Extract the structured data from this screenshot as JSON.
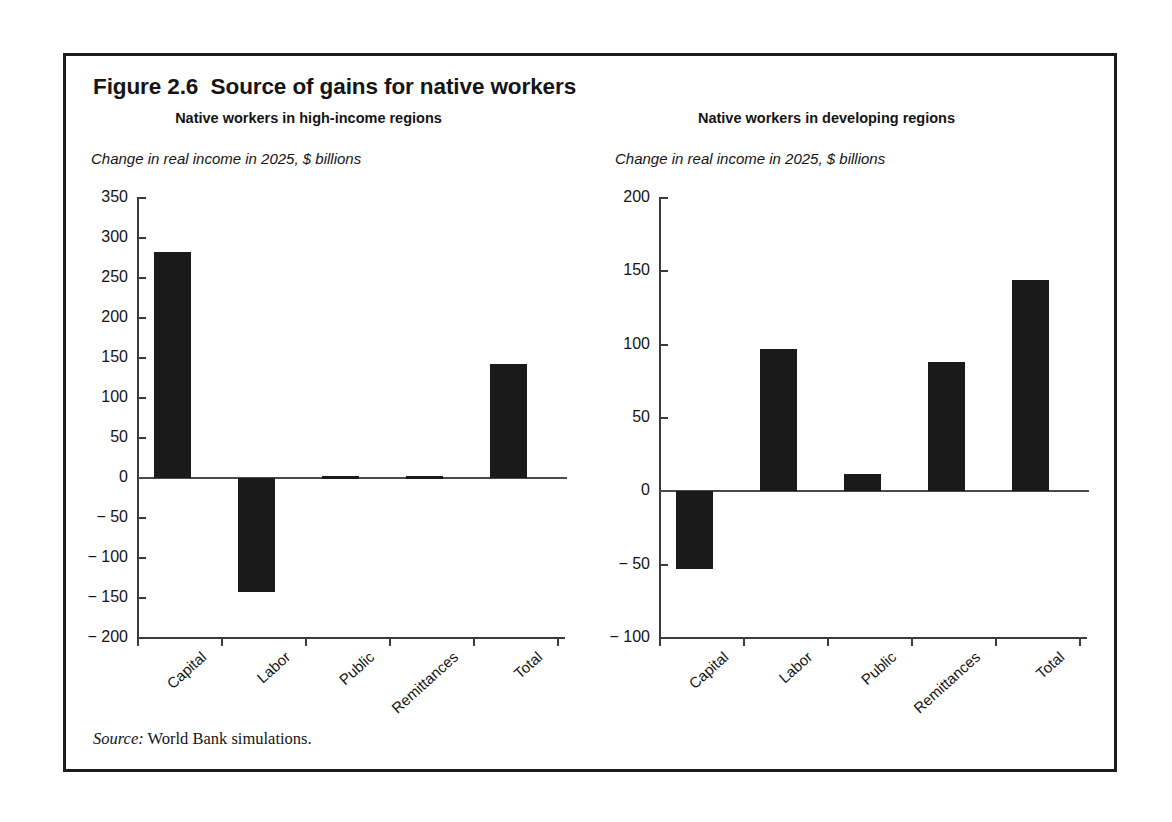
{
  "figure": {
    "title": "Figure 2.6  Source of gains for native workers",
    "source_prefix": "Source:",
    "source_text": " World Bank simulations."
  },
  "chart_data": [
    {
      "type": "bar",
      "title": "Native workers in high-income regions",
      "ylabel": "Change in real income in 2025, $ billions",
      "xlabel": "",
      "categories": [
        "Capital",
        "Labor",
        "Public",
        "Remittances",
        "Total"
      ],
      "values": [
        283,
        -143,
        2,
        3,
        143
      ],
      "ylim": [
        -200,
        350
      ],
      "yticks": [
        350,
        300,
        250,
        200,
        150,
        100,
        50,
        0,
        -50,
        -100,
        -150,
        -200
      ],
      "ytick_labels": [
        "350",
        "300",
        "250",
        "200",
        "150",
        "100",
        "50",
        "0",
        "− 50",
        "− 100",
        "− 150",
        "− 200"
      ],
      "grid": false,
      "legend": "none",
      "bar_color": "#1a1a1a"
    },
    {
      "type": "bar",
      "title": "Native workers in developing regions",
      "ylabel": "Change in real income in 2025, $ billions",
      "xlabel": "",
      "categories": [
        "Capital",
        "Labor",
        "Public",
        "Remittances",
        "Total"
      ],
      "values": [
        -53,
        97,
        12,
        88,
        144
      ],
      "ylim": [
        -100,
        200
      ],
      "yticks": [
        200,
        150,
        100,
        50,
        0,
        -50,
        -100
      ],
      "ytick_labels": [
        "200",
        "150",
        "100",
        "50",
        "0",
        "− 50",
        "− 100"
      ],
      "grid": false,
      "legend": "none",
      "bar_color": "#1a1a1a"
    }
  ]
}
